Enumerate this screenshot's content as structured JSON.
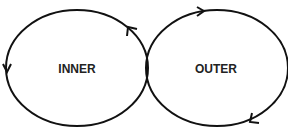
{
  "diagram": {
    "stroke_color": "#111111",
    "loops": [
      {
        "id": "inner",
        "label": "INNER",
        "cx": 77,
        "cy": 68,
        "rx": 71,
        "ry": 58
      },
      {
        "id": "outer",
        "label": "OUTER",
        "cx": 217,
        "cy": 68,
        "rx": 71,
        "ry": 58
      }
    ]
  }
}
